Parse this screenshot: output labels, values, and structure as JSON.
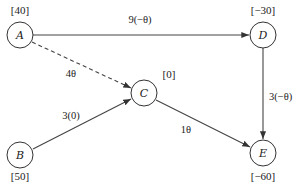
{
  "diagram": {
    "type": "directed-network",
    "nodes": [
      {
        "id": "A",
        "label": "A",
        "value": "[40]",
        "cx": 20,
        "cy": 35,
        "value_x": 20,
        "value_y": 13
      },
      {
        "id": "B",
        "label": "B",
        "value": "[50]",
        "cx": 20,
        "cy": 155,
        "value_x": 20,
        "value_y": 180
      },
      {
        "id": "C",
        "label": "C",
        "value": "[0]",
        "cx": 144,
        "cy": 93,
        "value_x": 169,
        "value_y": 78
      },
      {
        "id": "D",
        "label": "D",
        "value": "[−30]",
        "cx": 263,
        "cy": 35,
        "value_x": 263,
        "value_y": 13
      },
      {
        "id": "E",
        "label": "E",
        "value": "[−60]",
        "cx": 263,
        "cy": 153,
        "value_x": 263,
        "value_y": 180
      }
    ],
    "edges": [
      {
        "from": "A",
        "to": "D",
        "label": "9(−θ)",
        "style": "solid",
        "label_x": 140,
        "label_y": 23
      },
      {
        "from": "A",
        "to": "C",
        "label": "4θ",
        "style": "dashed",
        "label_x": 71,
        "label_y": 77
      },
      {
        "from": "B",
        "to": "C",
        "label": "3(0)",
        "style": "solid",
        "label_x": 71,
        "label_y": 119
      },
      {
        "from": "D",
        "to": "E",
        "label": "3(−θ)",
        "style": "solid",
        "label_x": 270,
        "label_y": 100
      },
      {
        "from": "C",
        "to": "E",
        "label": "1θ",
        "style": "solid",
        "label_x": 186,
        "label_y": 132
      }
    ]
  }
}
